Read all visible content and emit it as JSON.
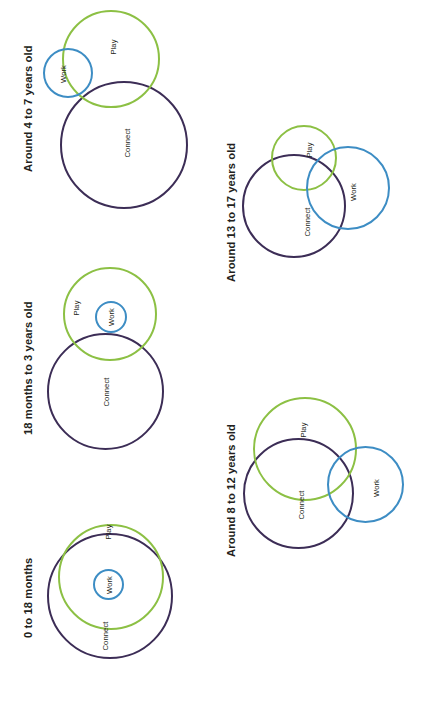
{
  "document": {
    "orientation": "rotated-90-ccw",
    "background": "#ffffff"
  },
  "colors": {
    "play": "#8cc044",
    "work": "#3d8dc4",
    "connect": "#3c2d56",
    "text": "#231f20"
  },
  "labels": {
    "play": "Play",
    "work": "Work",
    "connect": "Connect"
  },
  "panels": [
    {
      "id": "panel-0-18-months",
      "title": "0 to 18 months",
      "relationship": "Work inside Play inside Connect (concentric)"
    },
    {
      "id": "panel-18-months-to-3-years",
      "title": "18 months to 3 years old",
      "relationship": "Work inside Play; Play overlaps Connect"
    },
    {
      "id": "panel-4-to-7-years",
      "title": "Around 4 to 7 years old",
      "relationship": "Work overlaps Play; Play overlaps Connect"
    },
    {
      "id": "panel-8-to-12-years",
      "title": "Around 8 to 12 years old",
      "relationship": "Play, Work and Connect all overlap"
    },
    {
      "id": "panel-13-to-17-years",
      "title": "Around 13 to 17 years old",
      "relationship": "Play, Work and Connect all overlap, Work larger"
    }
  ]
}
